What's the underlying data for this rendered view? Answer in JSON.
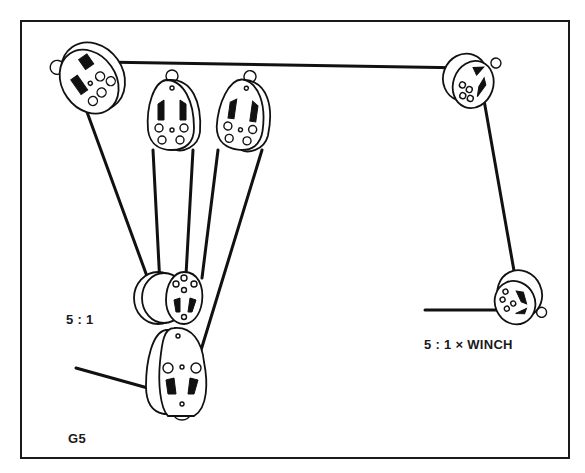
{
  "figure": {
    "id_label": "G5",
    "border": true
  },
  "labels": {
    "ratio": "5 : 1",
    "winch": "5 : 1 × WINCH"
  },
  "components": {
    "blocks": [
      {
        "name": "top-left-turning-block",
        "type": "single-pulley"
      },
      {
        "name": "upper-fiddle-block-1",
        "type": "pulley"
      },
      {
        "name": "upper-fiddle-block-2",
        "type": "pulley"
      },
      {
        "name": "lower-moving-block",
        "type": "double-pulley"
      },
      {
        "name": "lower-becket-block",
        "type": "pulley-with-becket"
      },
      {
        "name": "top-right-turning-block",
        "type": "single-pulley"
      },
      {
        "name": "bottom-right-turning-block",
        "type": "single-pulley"
      }
    ],
    "ropes": [
      "top-horizontal-line",
      "right-vertical-line",
      "winch-tail-line",
      "hauling-tail-line",
      "purchase-falls"
    ]
  },
  "colors": {
    "ink": "#111111",
    "paper": "#ffffff"
  }
}
